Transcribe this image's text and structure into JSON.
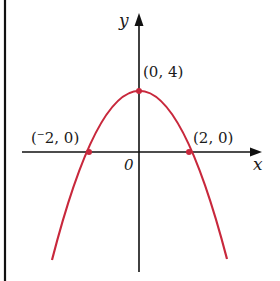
{
  "figure": {
    "type": "graph of a downward-opening parabola",
    "axes": {
      "x_label": "x",
      "y_label": "y",
      "origin_label": "0"
    },
    "points": [
      {
        "name": "vertex",
        "label": "(0, 4)",
        "x": 0,
        "y": 4
      },
      {
        "name": "left-root",
        "label": "(⁻2, 0)",
        "x": -2,
        "y": 0
      },
      {
        "name": "right-root",
        "label": "(2, 0)",
        "x": 2,
        "y": 0
      }
    ],
    "colors": {
      "curve": "#c8283c",
      "axes": "#111111",
      "border": "#111111"
    }
  }
}
